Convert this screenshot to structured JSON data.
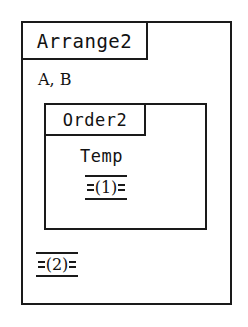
{
  "diagram": {
    "type": "nested-module-block-diagram",
    "background_color": "#ffffff",
    "line_color": "#1a1a1a",
    "text_color": "#121212",
    "outer_module": {
      "name": "Arrange2",
      "parameters": "A, B",
      "ref_marker": "(2)"
    },
    "inner_module": {
      "name": "Order2",
      "variable": "Temp",
      "ref_marker": "(1)"
    }
  }
}
